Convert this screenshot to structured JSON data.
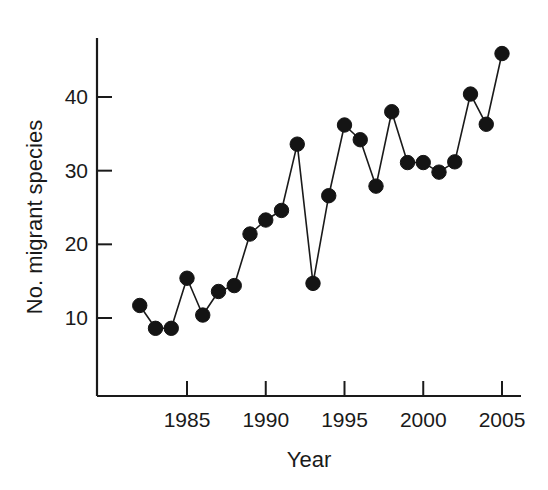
{
  "chart_data": {
    "type": "line",
    "title": "",
    "xlabel": "Year",
    "ylabel": "No. migrant species",
    "xlim": [
      1981.0,
      2006.0
    ],
    "ylim": [
      0,
      48
    ],
    "grid": false,
    "legend": "none",
    "marker": "filled-circle",
    "x": [
      1982,
      1983,
      1984,
      1985,
      1986,
      1987,
      1988,
      1989,
      1990,
      1991,
      1992,
      1993,
      1994,
      1995,
      1996,
      1997,
      1998,
      1999,
      2000,
      2001,
      2002,
      2003,
      2004,
      2005
    ],
    "values": [
      11.7,
      8.6,
      8.6,
      15.4,
      10.4,
      13.6,
      14.4,
      21.4,
      23.3,
      24.6,
      33.6,
      14.7,
      26.6,
      36.2,
      34.2,
      27.9,
      38.0,
      31.1,
      31.1,
      29.8,
      31.2,
      40.4,
      36.3,
      45.9
    ],
    "series": [
      {
        "name": "No. migrant species",
        "values": [
          11.7,
          8.6,
          8.6,
          15.4,
          10.4,
          13.6,
          14.4,
          21.4,
          23.3,
          24.6,
          33.6,
          14.7,
          26.6,
          36.2,
          34.2,
          27.9,
          38.0,
          31.1,
          31.1,
          29.8,
          31.2,
          40.4,
          36.3,
          45.9
        ]
      }
    ],
    "xticks": [
      1985,
      1990,
      1995,
      2000,
      2005
    ],
    "xtick_labels": [
      "1985",
      "1990",
      "1995",
      "2000",
      "2005"
    ],
    "yticks": [
      10,
      20,
      30,
      40
    ],
    "ytick_labels": [
      "10",
      "20",
      "30",
      "40"
    ],
    "colors": {
      "line": "#1a1a1a",
      "marker": "#141414",
      "axis": "#1a1a1a",
      "background": "#ffffff"
    }
  },
  "axis_titles": {
    "x": "Year",
    "y": "No. migrant species"
  }
}
